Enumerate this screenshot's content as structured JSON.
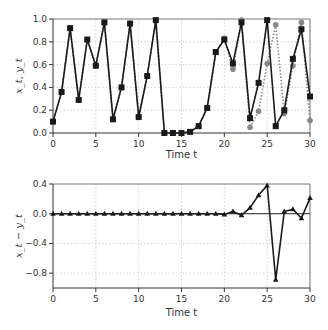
{
  "chart_data": [
    {
      "type": "line",
      "panel": "top",
      "title": "",
      "xlabel": "Time t",
      "ylabel": "x_t, y_t",
      "xlim": [
        0,
        30
      ],
      "ylim": [
        0,
        1.0
      ],
      "xticks": [
        0,
        5,
        10,
        15,
        20,
        25,
        30
      ],
      "yticks": [
        0.0,
        0.2,
        0.4,
        0.6,
        0.8,
        1.0
      ],
      "ytick_labels": [
        "0.0",
        "0.2",
        "0.4",
        "0.6",
        "0.8",
        "1.0"
      ],
      "grid": true,
      "x": [
        0,
        1,
        2,
        3,
        4,
        5,
        6,
        7,
        8,
        9,
        10,
        11,
        12,
        13,
        14,
        15,
        16,
        17,
        18,
        19,
        20,
        21,
        22,
        23,
        24,
        25,
        26,
        27,
        28,
        29,
        30
      ],
      "series": [
        {
          "name": "x_t",
          "style": "solid black line, square markers",
          "color": "#1a1a1a",
          "values": [
            0.1,
            0.36,
            0.92,
            0.29,
            0.82,
            0.59,
            0.97,
            0.12,
            0.4,
            0.96,
            0.14,
            0.5,
            0.99,
            0.0,
            0.0,
            0.0,
            0.01,
            0.06,
            0.22,
            0.71,
            0.82,
            0.61,
            0.97,
            0.13,
            0.44,
            0.99,
            0.06,
            0.2,
            0.65,
            0.91,
            0.32
          ]
        },
        {
          "name": "y_t",
          "style": "dotted gray line, circle markers",
          "color": "#888888",
          "values": [
            0.1,
            0.36,
            0.92,
            0.29,
            0.82,
            0.59,
            0.97,
            0.12,
            0.4,
            0.96,
            0.14,
            0.5,
            0.99,
            0.0,
            0.0,
            0.0,
            0.01,
            0.06,
            0.22,
            0.71,
            0.83,
            0.56,
            0.99,
            0.05,
            0.19,
            0.61,
            0.95,
            0.17,
            0.59,
            0.97,
            0.11
          ]
        }
      ]
    },
    {
      "type": "line",
      "panel": "bottom",
      "title": "",
      "xlabel": "Time t",
      "ylabel": "x_t − y_t",
      "xlim": [
        0,
        30
      ],
      "ylim": [
        -1.0,
        0.4
      ],
      "xticks": [
        0,
        5,
        10,
        15,
        20,
        25,
        30
      ],
      "yticks": [
        0.4,
        0.0,
        -0.4,
        -0.8
      ],
      "ytick_labels": [
        "0.4",
        "0.0",
        "−0.4",
        "−0.8"
      ],
      "grid": true,
      "zero_line": true,
      "x": [
        0,
        1,
        2,
        3,
        4,
        5,
        6,
        7,
        8,
        9,
        10,
        11,
        12,
        13,
        14,
        15,
        16,
        17,
        18,
        19,
        20,
        21,
        22,
        23,
        24,
        25,
        26,
        27,
        28,
        29,
        30
      ],
      "series": [
        {
          "name": "x_t − y_t",
          "style": "solid black line, triangle markers",
          "color": "#1a1a1a",
          "values": [
            0,
            0,
            0,
            0,
            0,
            0,
            0,
            0,
            0,
            0,
            0,
            0,
            0,
            0,
            0,
            0,
            0,
            0,
            0,
            0,
            -0.01,
            0.03,
            -0.02,
            0.08,
            0.25,
            0.38,
            -0.89,
            0.03,
            0.06,
            -0.06,
            0.21
          ]
        }
      ]
    }
  ],
  "labels": {
    "time_label_top": "Time t",
    "time_label_bottom": "Time t"
  }
}
